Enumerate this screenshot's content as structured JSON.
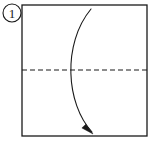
{
  "figure": {
    "kind": "origami-fold-instruction-diagram",
    "background_color": "#ffffff",
    "ink_color": "#1a1a1a",
    "step_badge": {
      "label": "1",
      "shape": "circle",
      "center_x": 12,
      "center_y": 13,
      "radius": 9,
      "stroke_color": "#1a1a1a"
    },
    "paper_square": {
      "name": "paper-outline",
      "x": 22,
      "y": 5,
      "width": 125,
      "height": 131,
      "stroke_color": "#1a1a1a",
      "stroke_width": 1.3,
      "fill": "#ffffff"
    },
    "crease_line": {
      "name": "horizontal-valley-crease",
      "style": "dashed",
      "orientation": "horizontal",
      "x_start": 22,
      "x_end": 147,
      "y": 70,
      "dash_length": 5,
      "dash_gap": 3,
      "stroke_color": "#1a1a1a",
      "stroke_width": 1.2
    },
    "fold_arrow": {
      "name": "fold-direction-arrow",
      "description": "curved arrow bowing left, from top edge down to bottom edge",
      "start_x": 91,
      "start_y": 9,
      "control1_x": 62,
      "control1_y": 44,
      "control2_x": 66,
      "control2_y": 104,
      "end_x": 92,
      "end_y": 132,
      "stroke_color": "#1a1a1a",
      "stroke_width": 1.1,
      "arrowhead": {
        "tip_x": 93,
        "tip_y": 134,
        "width": 8,
        "length": 12
      }
    }
  }
}
